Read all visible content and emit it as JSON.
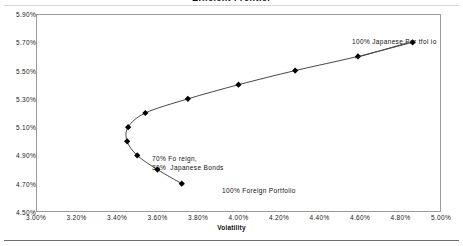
{
  "chart_data": {
    "type": "line",
    "title": "Efficient Frontier",
    "xlabel": "Volatility",
    "ylabel": "",
    "xlim": [
      3.0,
      5.0
    ],
    "ylim": [
      4.5,
      5.9
    ],
    "x_ticks": [
      "3.00%",
      "3.20%",
      "3.40%",
      "3.60%",
      "3.80%",
      "4.00%",
      "4.20%",
      "4.40%",
      "4.60%",
      "4.80%",
      "5.00%"
    ],
    "x_tick_values": [
      3.0,
      3.2,
      3.4,
      3.6,
      3.8,
      4.0,
      4.2,
      4.4,
      4.6,
      4.8,
      5.0
    ],
    "y_ticks": [
      "5.90%",
      "5.70%",
      "5.50%",
      "5.30%",
      "5.10%",
      "4.90%",
      "4.70%",
      "4.50%"
    ],
    "y_tick_values": [
      5.9,
      5.7,
      5.5,
      5.3,
      5.1,
      4.9,
      4.7,
      4.5
    ],
    "grid": false,
    "legend": "none",
    "marker": "diamond",
    "line_color": "#333333",
    "marker_color": "#000000",
    "series": [
      {
        "name": "Efficient Frontier",
        "x": [
          3.72,
          3.6,
          3.5,
          3.45,
          3.455,
          3.54,
          3.75,
          4.0,
          4.28,
          4.59,
          4.86
        ],
        "y": [
          4.7,
          4.8,
          4.9,
          5.0,
          5.1,
          5.2,
          5.3,
          5.4,
          5.5,
          5.6,
          5.7
        ]
      }
    ],
    "annotations": [
      {
        "name": "japanese-portfolio",
        "text": "100% Japanese Por tfol io",
        "x": 4.86,
        "y": 5.7
      },
      {
        "name": "mixed-portfolio",
        "text": "70% Fo reign,\n30%  Japanese Bonds",
        "x": 3.6,
        "y": 5.0
      },
      {
        "name": "foreign-portfolio",
        "text": "100% Foreign Portfolio",
        "x": 3.72,
        "y": 4.7
      }
    ]
  },
  "chart": {
    "title": "Efficient Frontier",
    "xlabel": "Volatility"
  }
}
